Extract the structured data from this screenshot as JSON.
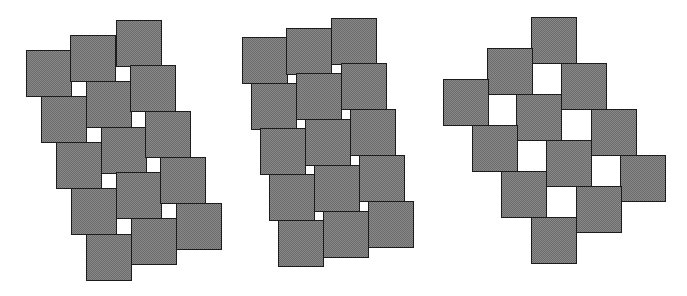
{
  "diagram": {
    "tile_size": 45,
    "colors": {
      "tile_fill": "#8a8a8a",
      "tile_border": "#1c1c1c",
      "gap": "#ffffff"
    },
    "figures": [
      {
        "name": "tiling-small-gaps",
        "tiles": [
          [
            26,
            50
          ],
          [
            70,
            35
          ],
          [
            116,
            20
          ],
          [
            41,
            96
          ],
          [
            86,
            81
          ],
          [
            130,
            65
          ],
          [
            56,
            142
          ],
          [
            101,
            127
          ],
          [
            145,
            111
          ],
          [
            71,
            188
          ],
          [
            116,
            172
          ],
          [
            160,
            157
          ],
          [
            86,
            234
          ],
          [
            131,
            218
          ],
          [
            176,
            203
          ]
        ]
      },
      {
        "name": "tiling-tiny-gaps",
        "tiles": [
          [
            242,
            37
          ],
          [
            286,
            28
          ],
          [
            331,
            18
          ],
          [
            251,
            83
          ],
          [
            296,
            73
          ],
          [
            341,
            63
          ],
          [
            260,
            128
          ],
          [
            305,
            119
          ],
          [
            350,
            109
          ],
          [
            269,
            174
          ],
          [
            314,
            165
          ],
          [
            359,
            155
          ],
          [
            278,
            220
          ],
          [
            323,
            211
          ],
          [
            368,
            201
          ]
        ]
      },
      {
        "name": "tiling-large-gaps",
        "tiles": [
          [
            531,
            17
          ],
          [
            487,
            48
          ],
          [
            561,
            63
          ],
          [
            443,
            79
          ],
          [
            516,
            94
          ],
          [
            591,
            109
          ],
          [
            472,
            125
          ],
          [
            546,
            140
          ],
          [
            620,
            155
          ],
          [
            501,
            171
          ],
          [
            576,
            186
          ],
          [
            531,
            217
          ]
        ]
      }
    ]
  }
}
